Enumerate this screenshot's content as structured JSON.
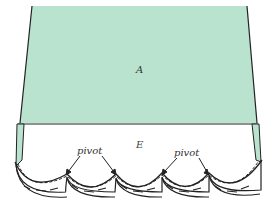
{
  "diagram": {
    "type": "sewing pattern illustration",
    "labels": {
      "panel_a": "A",
      "facing_e": "E",
      "pivot_left": "pivot",
      "pivot_right": "pivot"
    },
    "colors": {
      "panel_fill": "#b9e3cf",
      "outline": "#222222",
      "facing_fill": "#ffffff"
    }
  }
}
